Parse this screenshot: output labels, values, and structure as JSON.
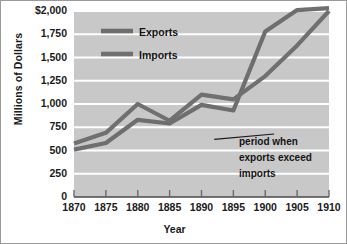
{
  "chart_data": {
    "type": "line",
    "title": "",
    "xlabel": "Year",
    "ylabel": "Millions of Dollars",
    "x": [
      1870,
      1875,
      1880,
      1885,
      1890,
      1895,
      1900,
      1905,
      1910
    ],
    "xlim": [
      1870,
      1910
    ],
    "ylim": [
      0,
      2000
    ],
    "ytick_labels": [
      "$2,000",
      "1,750",
      "1,500",
      "1,250",
      "1,000",
      "750",
      "500",
      "250",
      "0"
    ],
    "ytick_values": [
      2000,
      1750,
      1500,
      1250,
      1000,
      750,
      500,
      250,
      0
    ],
    "xtick_labels": [
      "1870",
      "1875",
      "1880",
      "1885",
      "1890",
      "1895",
      "1900",
      "1905",
      "1910"
    ],
    "grid": "horizontal",
    "legend_position": "top-left-inside",
    "series": [
      {
        "name": "Exports",
        "color": "#6e6e6e",
        "values": [
          510,
          580,
          830,
          790,
          990,
          930,
          1780,
          2010,
          2030
        ]
      },
      {
        "name": "Imports",
        "color": "#707070",
        "values": [
          575,
          690,
          1000,
          820,
          1100,
          1050,
          1300,
          1630,
          2000
        ]
      }
    ],
    "annotations": [
      {
        "text_lines": [
          "period when",
          "exports exceed",
          "imports"
        ],
        "leader_from_x": 1892,
        "leader_from_y": 620,
        "leader_to_x": 1897,
        "leader_to_y": 720
      }
    ],
    "plot_background": "#c8c8c8",
    "gridline_color": "#ffffff",
    "axis_color": "#4a4a4a"
  },
  "legend": {
    "exports_label": "Exports",
    "imports_label": "Imports"
  },
  "axes": {
    "y_title": "Millions of Dollars",
    "x_title": "Year"
  },
  "annotation": {
    "line1": "period when",
    "line2": "exports exceed",
    "line3": "imports"
  }
}
